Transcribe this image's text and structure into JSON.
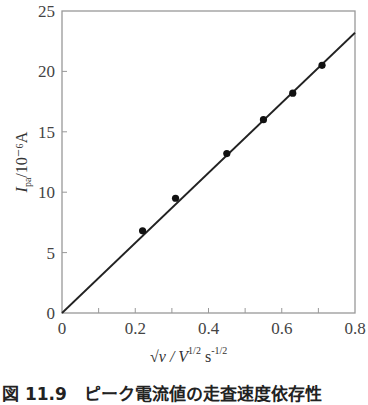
{
  "chart_data": {
    "type": "scatter",
    "title": "",
    "xlabel": "√v / V^(1/2) s^(-1/2)",
    "ylabel": "I_pa/10^-6 A",
    "xlim": [
      0,
      0.8
    ],
    "ylim": [
      0,
      25
    ],
    "x_ticks": [
      "0",
      "0.2",
      "0.4",
      "0.6",
      "0.8"
    ],
    "y_ticks": [
      "0",
      "5",
      "10",
      "15",
      "20",
      "25"
    ],
    "grid": false,
    "legend": null,
    "series": [
      {
        "name": "measured",
        "type": "scatter",
        "x": [
          0.22,
          0.31,
          0.45,
          0.55,
          0.63,
          0.71
        ],
        "y": [
          6.8,
          9.5,
          13.2,
          16.0,
          18.2,
          20.5
        ]
      },
      {
        "name": "linear fit",
        "type": "line",
        "x": [
          0,
          0.8
        ],
        "y": [
          0,
          23.2
        ]
      }
    ]
  },
  "axes": {
    "x_label_main": "√v / V",
    "x_label_exp1": "1/2",
    "x_label_s": "s",
    "x_label_exp2": "-1/2",
    "y_label_main": "I",
    "y_label_sub": "pa",
    "y_label_unit": "/10⁻⁶A",
    "x_origin_label": "0",
    "y_origin_label": "0"
  },
  "caption": "図 11.9　ピーク電流値の走査速度依存性"
}
